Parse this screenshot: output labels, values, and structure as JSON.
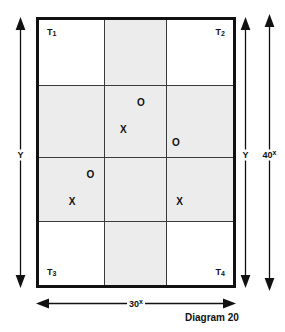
{
  "diagram": {
    "caption": "Diagram 20",
    "rect": {
      "corner_labels": [
        {
          "name": "T1",
          "text": "T",
          "sub": "1",
          "position": "top-left"
        },
        {
          "name": "T2",
          "text": "T",
          "sub": "2",
          "position": "top-right"
        },
        {
          "name": "T3",
          "text": "T",
          "sub": "3",
          "position": "bottom-left"
        },
        {
          "name": "T4",
          "text": "T",
          "sub": "4",
          "position": "bottom-right"
        }
      ],
      "grid": {
        "columns": 3,
        "rows": 4,
        "shaded_column_index": 1,
        "shaded_row_indices": [
          1,
          2
        ],
        "shade_color": "#ececec",
        "line_color": "#3a3a3a",
        "border_color": "#111111"
      }
    },
    "markers": [
      {
        "label": "O",
        "x_pct": 52.5,
        "y_pct": 31.5
      },
      {
        "label": "X",
        "x_pct": 43.5,
        "y_pct": 41.5
      },
      {
        "label": "O",
        "x_pct": 70.5,
        "y_pct": 46.5
      },
      {
        "label": "O",
        "x_pct": 26.5,
        "y_pct": 58.5
      },
      {
        "label": "X",
        "x_pct": 17.0,
        "y_pct": 68.5
      },
      {
        "label": "X",
        "x_pct": 72.5,
        "y_pct": 68.5
      }
    ],
    "dimensions": {
      "left_vertical": {
        "label": "Y",
        "sup": ""
      },
      "right_vertical_inner": {
        "label": "Y",
        "sup": ""
      },
      "right_vertical_outer": {
        "label": "40",
        "sup": "x"
      },
      "bottom_horizontal": {
        "label": "30",
        "sup": "x"
      }
    }
  }
}
